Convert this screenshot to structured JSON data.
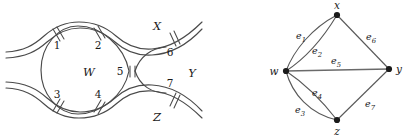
{
  "figure": {
    "background_color": "#ffffff",
    "stroke_color": "#4a4a4a",
    "node_color": "#1a1a1a",
    "width": 408,
    "height": 139
  },
  "knot_diagram": {
    "name": "knot-projection",
    "crossings": [
      {
        "id": "1",
        "label": "1",
        "x": 57,
        "y": 45
      },
      {
        "id": "2",
        "label": "2",
        "x": 98,
        "y": 45
      },
      {
        "id": "3",
        "label": "3",
        "x": 57,
        "y": 95
      },
      {
        "id": "4",
        "label": "4",
        "x": 98,
        "y": 95
      },
      {
        "id": "5",
        "label": "5",
        "x": 131,
        "y": 71
      },
      {
        "id": "6",
        "label": "6",
        "x": 174,
        "y": 46
      },
      {
        "id": "7",
        "label": "7",
        "x": 174,
        "y": 93
      }
    ],
    "regions": [
      {
        "id": "W",
        "label": "W",
        "x": 89,
        "y": 72
      },
      {
        "id": "X",
        "label": "X",
        "x": 157,
        "y": 27
      },
      {
        "id": "Y",
        "label": "Y",
        "x": 190,
        "y": 73
      },
      {
        "id": "Z",
        "label": "Z",
        "x": 157,
        "y": 117
      }
    ]
  },
  "graph_diagram": {
    "name": "associated-graph",
    "vertices": [
      {
        "id": "x",
        "label": "x",
        "cx": 337,
        "cy": 15,
        "label_x": 337,
        "label_y": 8
      },
      {
        "id": "w",
        "label": "w",
        "cx": 286,
        "cy": 71,
        "label_x": 275,
        "label_y": 74
      },
      {
        "id": "y",
        "label": "y",
        "cx": 389,
        "cy": 69,
        "label_x": 398,
        "label_y": 73
      },
      {
        "id": "z",
        "label": "z",
        "cx": 337,
        "cy": 120,
        "label_x": 337,
        "label_y": 134
      }
    ],
    "edges": [
      {
        "id": "e1",
        "label": "e",
        "sub": "1",
        "from": "w",
        "to": "x",
        "label_x": 301,
        "label_y": 36
      },
      {
        "id": "e2",
        "label": "e",
        "sub": "2",
        "from": "w",
        "to": "x",
        "label_x": 316,
        "label_y": 51
      },
      {
        "id": "e3",
        "label": "e",
        "sub": "3",
        "from": "w",
        "to": "z",
        "label_x": 300,
        "label_y": 110
      },
      {
        "id": "e4",
        "label": "e",
        "sub": "4",
        "from": "w",
        "to": "z",
        "label_x": 316,
        "label_y": 94
      },
      {
        "id": "e5",
        "label": "e",
        "sub": "5",
        "from": "w",
        "to": "y",
        "label_x": 335,
        "label_y": 63
      },
      {
        "id": "e6",
        "label": "e",
        "sub": "6",
        "from": "x",
        "to": "y",
        "label_x": 370,
        "label_y": 38
      },
      {
        "id": "e7",
        "label": "e",
        "sub": "7",
        "from": "z",
        "to": "y",
        "label_x": 369,
        "label_y": 104
      }
    ]
  }
}
